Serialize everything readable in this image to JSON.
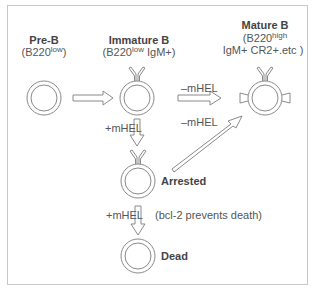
{
  "diagram": {
    "nodes": {
      "pre_b": {
        "title": "Pre-B",
        "marker_prefix": "(B220",
        "marker_sup": "low",
        "marker_suffix": ")"
      },
      "immature_b": {
        "title": "Immature B",
        "marker_prefix": "(B220",
        "marker_sup": "low",
        "marker_suffix": " IgM+)"
      },
      "mature_b": {
        "title": "Mature B",
        "marker_line1_prefix": "(B220",
        "marker_line1_sup": "high",
        "marker_line2": "IgM+ CR2+.etc )"
      },
      "arrested": {
        "title": "Arrested"
      },
      "dead": {
        "title": "Dead"
      }
    },
    "edges": {
      "immature_to_mature": "–mHEL",
      "immature_to_arrested": "+mHEL",
      "arrested_to_mature": "–mHEL",
      "arrested_to_dead": "+mHEL",
      "arrested_to_dead_note": "(bcl-2 prevents death)"
    },
    "colors": {
      "line": "#8a8a8a",
      "text": "#555555",
      "border": "#c8c8c8"
    }
  }
}
